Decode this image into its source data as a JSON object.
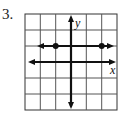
{
  "problem": {
    "number": "3."
  },
  "graph": {
    "x_label": "x",
    "y_label": "y",
    "grid": {
      "cols": 6,
      "rows": 6,
      "x_range": [
        -3,
        3
      ],
      "y_range": [
        -3,
        3
      ]
    },
    "line": {
      "type": "horizontal",
      "y": 1,
      "arrows": "both"
    },
    "points": [
      {
        "x": -1,
        "y": 1,
        "filled": true
      },
      {
        "x": 2,
        "y": 1,
        "filled": true
      }
    ]
  }
}
